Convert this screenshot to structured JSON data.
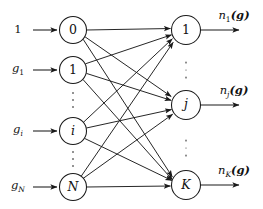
{
  "figure": {
    "width": 263,
    "height": 209,
    "background_color": "#ffffff",
    "ink_color": "#1a1a1a"
  },
  "input_layer": {
    "nodes": [
      {
        "label": "0",
        "style": "upright",
        "cx": 73,
        "cy": 30,
        "r": 13.5
      },
      {
        "label": "1",
        "style": "upright",
        "cx": 73,
        "cy": 70,
        "r": 13.5
      },
      {
        "label": "i",
        "style": "italic",
        "cx": 73,
        "cy": 131,
        "r": 13.5
      },
      {
        "label": "N",
        "style": "italic",
        "cx": 73,
        "cy": 187,
        "r": 13.5
      }
    ],
    "ellipsis": [
      {
        "cx": 73,
        "cy": 100
      },
      {
        "cx": 73,
        "cy": 159
      }
    ],
    "signal_labels": [
      {
        "base": "1",
        "sub": "",
        "style": "upright",
        "x": 18,
        "y": 30
      },
      {
        "base": "g",
        "sub": "1",
        "sub_style": "upright",
        "style": "italic",
        "x": 18,
        "y": 70
      },
      {
        "base": "g",
        "sub": "i",
        "sub_style": "italic",
        "style": "italic",
        "x": 18,
        "y": 131
      },
      {
        "base": "g",
        "sub": "N",
        "sub_style": "italic",
        "style": "italic",
        "x": 18,
        "y": 187
      }
    ]
  },
  "output_layer": {
    "nodes": [
      {
        "label": "1",
        "style": "upright",
        "cx": 186,
        "cy": 30,
        "r": 14.5
      },
      {
        "label": "j",
        "style": "italic",
        "cx": 186,
        "cy": 105,
        "r": 14.5
      },
      {
        "label": "K",
        "style": "italic",
        "cx": 186,
        "cy": 185,
        "r": 14.5
      }
    ],
    "ellipsis": [
      {
        "cx": 186,
        "cy": 70
      },
      {
        "cx": 186,
        "cy": 148
      }
    ],
    "signal_labels": [
      {
        "base": "n",
        "sub": "1",
        "sub_style": "upright",
        "arg": "(g)",
        "x": 234,
        "y": 17
      },
      {
        "base": "n",
        "sub": "j",
        "sub_style": "italic",
        "arg": "(g)",
        "x": 234,
        "y": 92
      },
      {
        "base": "n",
        "sub": "K",
        "sub_style": "italic",
        "arg": "(g)",
        "x": 234,
        "y": 172
      }
    ]
  },
  "connections": {
    "description": "fully connected bipartite edges, every input node to every output node",
    "count": 12,
    "edges": [
      {
        "from": "0",
        "to": "1"
      },
      {
        "from": "0",
        "to": "j"
      },
      {
        "from": "0",
        "to": "K"
      },
      {
        "from": "1",
        "to": "1"
      },
      {
        "from": "1",
        "to": "j"
      },
      {
        "from": "1",
        "to": "K"
      },
      {
        "from": "i",
        "to": "1"
      },
      {
        "from": "i",
        "to": "j"
      },
      {
        "from": "i",
        "to": "K"
      },
      {
        "from": "N",
        "to": "1"
      },
      {
        "from": "N",
        "to": "j"
      },
      {
        "from": "N",
        "to": "K"
      }
    ]
  },
  "input_arrows": [
    {
      "x1": 33,
      "y": 30,
      "x2": 58
    },
    {
      "x1": 33,
      "y": 70,
      "x2": 58
    },
    {
      "x1": 33,
      "y": 131,
      "x2": 58
    },
    {
      "x1": 33,
      "y": 187,
      "x2": 58
    }
  ],
  "output_arrows": [
    {
      "x1": 201,
      "y": 30,
      "x2": 240
    },
    {
      "x1": 201,
      "y": 105,
      "x2": 240
    },
    {
      "x1": 201,
      "y": 185,
      "x2": 240
    }
  ]
}
